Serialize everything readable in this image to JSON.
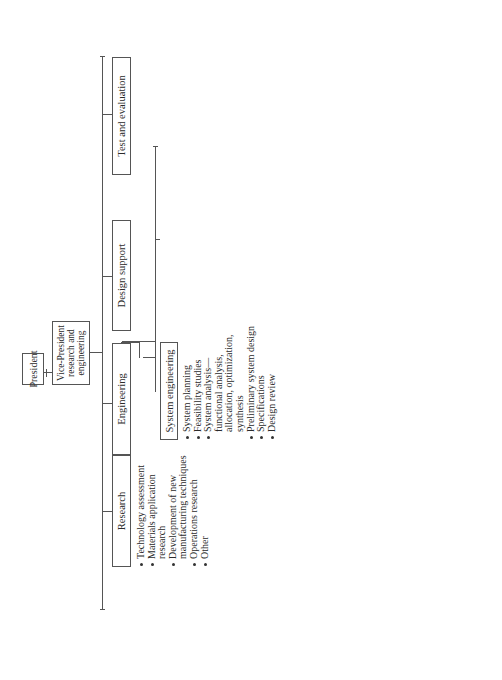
{
  "president": {
    "label": "President"
  },
  "vp": {
    "label": "Vice-President research and engineering"
  },
  "departments": [
    {
      "label": "Research",
      "items": [
        "Technology assessment",
        "Materials application research",
        "Development of new manufacturing techniques",
        "Operations research",
        "Other"
      ]
    },
    {
      "label": "Engineering",
      "groups": [
        {
          "label": "System engineering",
          "items": [
            "System planning",
            "Feasibility studies",
            "System analysis— functional analysis, allocation, optimization, synthesis",
            "Preliminary system design",
            "Specifications",
            "Design review"
          ]
        },
        {
          "label": "Electrical design",
          "items": [
            "Circuit analysis, design, and component application",
            "Wiring and cable harnesses",
            "Test requirements"
          ]
        },
        {
          "label": "Mechanical design",
          "items": [
            "Structural analysis and design",
            "Material selection and application",
            "Functional layout and packaging",
            "Interface requirements",
            "Test requirements"
          ]
        }
      ]
    },
    {
      "label": "Design support",
      "groups": [
        {
          "label": "Reliability engineering",
          "items": [
            "Reliability requirements, analysis, and component selection",
            "Predictions and assessment",
            "Design review",
            "Test requirements"
          ]
        },
        {
          "label": "Maintainability engineering",
          "items": [
            "Maintainability requirements, analysis, and component selection",
            "Predictions and assessment",
            "Design review",
            "Test requirements"
          ]
        },
        {
          "label": "Logistics engineering",
          "items": [
            "Support concepts",
            "Supportability analysis",
            "Logistic support requirements",
            "Design review"
          ]
        }
      ]
    },
    {
      "label": "Test and evaluation",
      "groups": [
        {
          "label": "Types 1 and 2 testing",
          "items": [
            "Component testing",
            "Engineering model testing",
            "Prototype testing— reliability and maintainability tests, environmental tests, logistic support compatibility tests, sand and salt spray tests, humidity tests, EMI tests, etc."
          ]
        },
        {
          "label": "Type 3 testing",
          "items": [
            "System test and evaluation",
            "Data collection, analysis and reporting"
          ]
        }
      ]
    }
  ]
}
